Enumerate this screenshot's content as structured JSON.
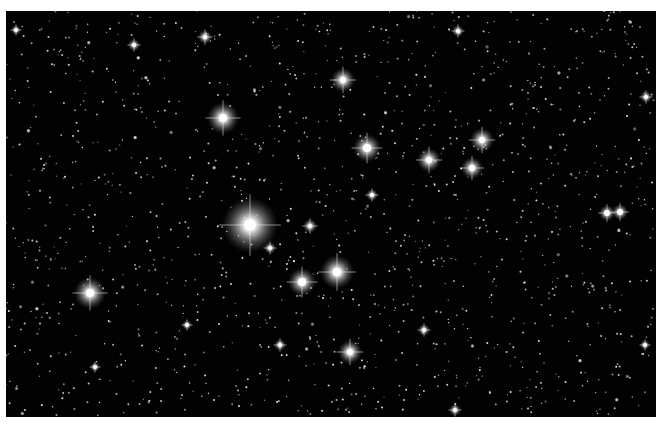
{
  "image": {
    "subject": "star field",
    "background_color": "#020202",
    "margin_color": "#ffffff",
    "frame": {
      "x": 6,
      "y": 11,
      "width": 650,
      "height": 406
    }
  },
  "bright_stars": [
    {
      "x": 250,
      "y": 225,
      "r": 28,
      "core": 6
    },
    {
      "x": 223,
      "y": 118,
      "r": 16,
      "core": 4
    },
    {
      "x": 90,
      "y": 293,
      "r": 16,
      "core": 4
    },
    {
      "x": 337,
      "y": 272,
      "r": 17,
      "core": 4
    },
    {
      "x": 302,
      "y": 282,
      "r": 14,
      "core": 4
    },
    {
      "x": 343,
      "y": 80,
      "r": 12,
      "core": 3
    },
    {
      "x": 367,
      "y": 148,
      "r": 14,
      "core": 4
    },
    {
      "x": 429,
      "y": 160,
      "r": 12,
      "core": 3
    },
    {
      "x": 482,
      "y": 140,
      "r": 12,
      "core": 3
    },
    {
      "x": 472,
      "y": 168,
      "r": 11,
      "core": 3
    },
    {
      "x": 350,
      "y": 352,
      "r": 12,
      "core": 3
    },
    {
      "x": 607,
      "y": 213,
      "r": 8,
      "core": 3
    },
    {
      "x": 620,
      "y": 212,
      "r": 8,
      "core": 3
    },
    {
      "x": 205,
      "y": 37,
      "r": 7,
      "core": 2
    },
    {
      "x": 134,
      "y": 45,
      "r": 6,
      "core": 2
    },
    {
      "x": 458,
      "y": 31,
      "r": 6,
      "core": 2
    },
    {
      "x": 310,
      "y": 226,
      "r": 7,
      "core": 2
    },
    {
      "x": 270,
      "y": 248,
      "r": 6,
      "core": 2
    },
    {
      "x": 372,
      "y": 195,
      "r": 6,
      "core": 2
    },
    {
      "x": 280,
      "y": 345,
      "r": 6,
      "core": 2
    },
    {
      "x": 424,
      "y": 330,
      "r": 6,
      "core": 2
    },
    {
      "x": 455,
      "y": 410,
      "r": 6,
      "core": 2
    },
    {
      "x": 646,
      "y": 97,
      "r": 6,
      "core": 2
    },
    {
      "x": 16,
      "y": 30,
      "r": 5,
      "core": 2
    },
    {
      "x": 95,
      "y": 367,
      "r": 5,
      "core": 2
    },
    {
      "x": 187,
      "y": 325,
      "r": 5,
      "core": 2
    },
    {
      "x": 645,
      "y": 345,
      "r": 5,
      "core": 2
    }
  ],
  "field": {
    "star_count": 1400,
    "seed": 7
  }
}
